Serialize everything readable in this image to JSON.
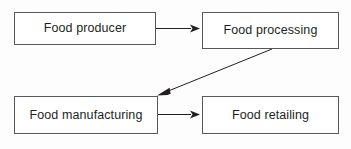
{
  "diagram": {
    "type": "flowchart",
    "background_color": "#fdfdfd",
    "box_fill_color": "#ffffff",
    "box_border_color": "#58585a",
    "text_color": "#231f20",
    "arrow_color": "#231f20",
    "nodes": [
      {
        "id": "producer",
        "label": "Food producer"
      },
      {
        "id": "processing",
        "label": "Food processing"
      },
      {
        "id": "manufacturing",
        "label": "Food manufacturing"
      },
      {
        "id": "retailing",
        "label": "Food retailing"
      }
    ],
    "edges": [
      {
        "from": "producer",
        "to": "processing",
        "direction": "right",
        "style": "solid-arrow"
      },
      {
        "from": "processing",
        "to": "manufacturing",
        "direction": "diagonal-down-left",
        "style": "solid-arrow"
      },
      {
        "from": "manufacturing",
        "to": "retailing",
        "direction": "right",
        "style": "solid-arrow"
      }
    ]
  }
}
